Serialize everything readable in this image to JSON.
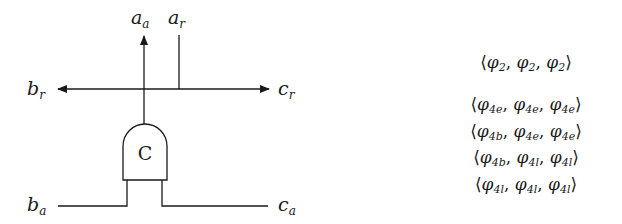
{
  "diagram": {
    "gate_label": "C",
    "ports": {
      "a_a": {
        "base": "a",
        "sub": "a"
      },
      "a_r": {
        "base": "a",
        "sub": "r"
      },
      "b_r": {
        "base": "b",
        "sub": "r"
      },
      "c_r": {
        "base": "c",
        "sub": "r"
      },
      "b_a": {
        "base": "b",
        "sub": "a"
      },
      "c_a": {
        "base": "c",
        "sub": "a"
      }
    },
    "colors": {
      "stroke": "#1a1a1a",
      "background": "#ffffff"
    }
  },
  "tuples": {
    "symbol": "φ",
    "open": "⟨",
    "close": "⟩",
    "sep": ", ",
    "rows": [
      {
        "subs": [
          "2",
          "2",
          "2"
        ]
      },
      {
        "subs": [
          "4e",
          "4e",
          "4e"
        ]
      },
      {
        "subs": [
          "4b",
          "4e",
          "4e"
        ]
      },
      {
        "subs": [
          "4b",
          "4l",
          "4l"
        ]
      },
      {
        "subs": [
          "4l",
          "4l",
          "4l"
        ]
      }
    ]
  }
}
